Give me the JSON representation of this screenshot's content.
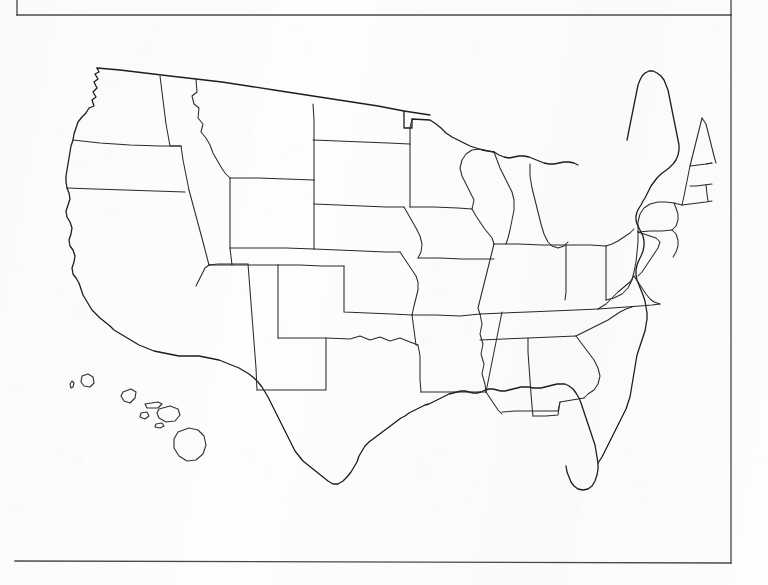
{
  "document": {
    "kind": "scanned-blank-map-worksheet",
    "title": "United States State Outline Map",
    "background_color": "#fdfdfd",
    "ink_color": "#2a2a2a"
  },
  "frame": {
    "name": "page-border-rule",
    "description": "Partial printed page border from the scanned sheet",
    "top_rule": {
      "x1": 17,
      "y1": 15,
      "x2": 731,
      "y2": 15
    },
    "right_rule": {
      "x1": 731,
      "y1": 15,
      "x2": 731,
      "y2": 563
    },
    "bottom_rule": {
      "x1": 15,
      "y1": 561,
      "x2": 731,
      "y2": 563
    },
    "top_left_stub": {
      "x1": 17,
      "y1": 15,
      "x2": 17,
      "y2": 0
    },
    "top_right_stub": {
      "x1": 731,
      "y1": 15,
      "x2": 731,
      "y2": 0
    },
    "stroke_color": "#4a4a4a"
  },
  "map": {
    "name": "united-states-outline-map",
    "projection": "Albers equal-area conic",
    "has_labels": false,
    "has_fill": false,
    "includes_insets": [
      "hawaii"
    ],
    "bounds": {
      "x": 62,
      "y": 62,
      "width": 655,
      "height": 435
    },
    "contiguous_state_count": 48,
    "regions": [
      {
        "name": "pacific-northwest",
        "states": [
          "Washington",
          "Oregon",
          "Idaho"
        ]
      },
      {
        "name": "west",
        "states": [
          "California",
          "Nevada",
          "Arizona",
          "Utah"
        ]
      },
      {
        "name": "mountain",
        "states": [
          "Montana",
          "Wyoming",
          "Colorado",
          "New Mexico"
        ]
      },
      {
        "name": "great-plains",
        "states": [
          "North Dakota",
          "South Dakota",
          "Nebraska",
          "Kansas",
          "Oklahoma",
          "Texas"
        ]
      },
      {
        "name": "midwest",
        "states": [
          "Minnesota",
          "Iowa",
          "Missouri",
          "Wisconsin",
          "Illinois",
          "Michigan",
          "Indiana",
          "Ohio"
        ]
      },
      {
        "name": "south",
        "states": [
          "Arkansas",
          "Louisiana",
          "Mississippi",
          "Alabama",
          "Tennessee",
          "Kentucky",
          "Georgia",
          "Florida",
          "South Carolina",
          "North Carolina"
        ]
      },
      {
        "name": "mid-atlantic",
        "states": [
          "Virginia",
          "West Virginia",
          "Maryland",
          "Delaware",
          "Pennsylvania",
          "New Jersey",
          "New York"
        ]
      },
      {
        "name": "new-england",
        "states": [
          "Maine",
          "New Hampshire",
          "Vermont",
          "Massachusetts",
          "Connecticut",
          "Rhode Island"
        ]
      }
    ],
    "insets": [
      {
        "name": "hawaii-inset",
        "label": "",
        "islands": [
          "Niihau",
          "Kauai",
          "Oahu",
          "Molokai",
          "Lanai",
          "Maui",
          "Kahoolawe",
          "Hawaii"
        ],
        "bounds": {
          "x": 66,
          "y": 370,
          "width": 130,
          "height": 105
        }
      }
    ]
  }
}
